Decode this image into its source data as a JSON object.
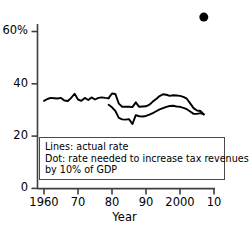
{
  "chart_data": {
    "type": "line",
    "title": "",
    "subtitle": "",
    "xlabel": "Year",
    "ylabel": "",
    "xlim": [
      1960,
      2010
    ],
    "ylim": [
      0,
      68
    ],
    "grid": false,
    "legend_position": "inside-lower-left",
    "y_ticks": [
      {
        "value": 0,
        "label": "0"
      },
      {
        "value": 20,
        "label": "20"
      },
      {
        "value": 40,
        "label": "40"
      },
      {
        "value": 60,
        "label": "60%"
      }
    ],
    "x_ticks": [
      {
        "value": 1960,
        "label": "1960"
      },
      {
        "value": 1970,
        "label": "70"
      },
      {
        "value": 1980,
        "label": "80"
      },
      {
        "value": 1990,
        "label": "90"
      },
      {
        "value": 2000,
        "label": "2000"
      },
      {
        "value": 2010,
        "label": "10"
      }
    ],
    "annotations": [
      "Lines: actual rate",
      "Dot: rate needed to increase tax revenues",
      "by 10% of GDP"
    ],
    "series": [
      {
        "name": "actual rate (combined, pre-1979)",
        "type": "line",
        "color": "#000000",
        "x": [
          1960,
          1961,
          1962,
          1963,
          1964,
          1965,
          1966,
          1967,
          1968,
          1969,
          1970,
          1971,
          1972,
          1973,
          1974,
          1975,
          1976,
          1977,
          1978,
          1979
        ],
        "values": [
          33.5,
          34.2,
          34.6,
          34.5,
          34.4,
          34.6,
          33.6,
          33.4,
          34.6,
          36.2,
          34.0,
          33.5,
          34.6,
          33.8,
          34.8,
          34.0,
          34.6,
          34.8,
          34.6,
          34.5
        ]
      },
      {
        "name": "actual rate upper branch",
        "type": "line",
        "color": "#000000",
        "x": [
          1979,
          1980,
          1981,
          1982,
          1983,
          1984,
          1985,
          1986,
          1987,
          1988,
          1989,
          1990,
          1991,
          1992,
          1993,
          1994,
          1995,
          1996,
          1997,
          1998,
          1999,
          2000,
          2001,
          2002,
          2003,
          2004,
          2005,
          2006,
          2007
        ],
        "values": [
          34.5,
          36.3,
          36.1,
          32.4,
          31.2,
          31.2,
          31.2,
          31.1,
          32.9,
          31.2,
          31.3,
          31.4,
          32.0,
          33.2,
          34.2,
          35.3,
          36.0,
          35.8,
          35.4,
          35.6,
          35.5,
          35.4,
          35.0,
          34.3,
          32.5,
          30.7,
          29.8,
          29.6,
          28.3
        ]
      },
      {
        "name": "actual rate lower branch",
        "type": "line",
        "color": "#000000",
        "x": [
          1979,
          1980,
          1981,
          1982,
          1983,
          1984,
          1985,
          1986,
          1987,
          1988,
          1989,
          1990,
          1991,
          1992,
          1993,
          1994,
          1995,
          1996,
          1997,
          1998,
          1999,
          2000,
          2001,
          2002,
          2003,
          2004,
          2005,
          2006,
          2007
        ],
        "values": [
          32.0,
          31.0,
          29.6,
          27.0,
          26.4,
          26.3,
          26.5,
          24.6,
          28.0,
          27.6,
          27.5,
          27.7,
          28.2,
          28.8,
          29.5,
          30.2,
          30.7,
          31.2,
          31.5,
          31.6,
          31.3,
          31.2,
          30.8,
          30.3,
          29.4,
          28.5,
          28.5,
          28.8,
          28.3
        ]
      }
    ],
    "points": [
      {
        "name": "rate needed to increase tax revenues by 10% of GDP",
        "type": "scatter",
        "color": "#000000",
        "x": 2007,
        "y": 65.5,
        "marker": "filled-circle",
        "size": 9
      }
    ]
  },
  "axis": {
    "x_title": "Year"
  },
  "legend": {
    "line1": "Lines: actual rate",
    "line2": "Dot: rate needed to increase tax revenues",
    "line3": "by 10% of GDP"
  },
  "ytick_labels": {
    "t0": "0",
    "t20": "20",
    "t40": "40",
    "t60": "60%"
  },
  "xtick_labels": {
    "t1960": "1960",
    "t1970": "70",
    "t1980": "80",
    "t1990": "90",
    "t2000": "2000",
    "t2010": "10"
  },
  "colors": {
    "line": "#000000",
    "dot": "#000000",
    "axis": "#3f3f3f",
    "legend_border": "#4a4a4a",
    "background": "#ffffff"
  }
}
